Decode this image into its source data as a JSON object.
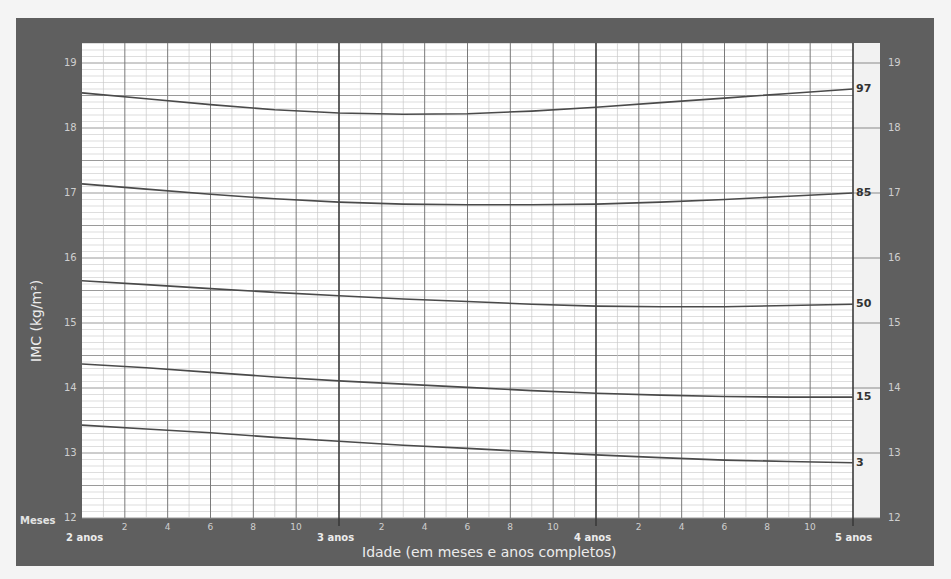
{
  "chart_data": {
    "type": "line",
    "title": "",
    "xlabel": "Idade (em meses e anos completos)",
    "ylabel": "IMC (kg/m²)",
    "x_unit": "months of age",
    "xlim": [
      24,
      60
    ],
    "ylim": [
      12,
      19.3
    ],
    "grid": true,
    "y_ticks": [
      12,
      13,
      14,
      15,
      16,
      17,
      18,
      19
    ],
    "x_month_ticks_label": "Meses",
    "x_month_ticks": [
      "2",
      "4",
      "6",
      "8",
      "10"
    ],
    "x_year_ticks": [
      {
        "label": "2 anos",
        "month": 24
      },
      {
        "label": "3 anos",
        "month": 36
      },
      {
        "label": "4 anos",
        "month": 48
      },
      {
        "label": "5 anos",
        "month": 60
      }
    ],
    "x": [
      24,
      27,
      30,
      33,
      36,
      39,
      42,
      45,
      48,
      51,
      54,
      57,
      60
    ],
    "series": [
      {
        "name": "97",
        "values": [
          18.54,
          18.45,
          18.36,
          18.28,
          18.23,
          18.21,
          18.22,
          18.26,
          18.32,
          18.39,
          18.46,
          18.53,
          18.6
        ]
      },
      {
        "name": "85",
        "values": [
          17.14,
          17.06,
          16.98,
          16.91,
          16.86,
          16.83,
          16.82,
          16.82,
          16.83,
          16.86,
          16.9,
          16.95,
          17.0
        ]
      },
      {
        "name": "50",
        "values": [
          15.65,
          15.59,
          15.53,
          15.47,
          15.42,
          15.37,
          15.33,
          15.29,
          15.26,
          15.25,
          15.25,
          15.27,
          15.29
        ]
      },
      {
        "name": "15",
        "values": [
          14.37,
          14.31,
          14.24,
          14.17,
          14.11,
          14.06,
          14.01,
          13.96,
          13.92,
          13.89,
          13.87,
          13.86,
          13.86
        ]
      },
      {
        "name": "3",
        "values": [
          13.43,
          13.37,
          13.31,
          13.24,
          13.18,
          13.12,
          13.07,
          13.02,
          12.97,
          12.93,
          12.89,
          12.87,
          12.85
        ]
      }
    ],
    "legend": "inline right labels: 97, 85, 50, 15, 3"
  },
  "axis": {
    "y_title": "IMC (kg/m²)",
    "x_title": "Idade (em meses e anos completos)",
    "meses_label": "Meses"
  },
  "colors": {
    "frame": "#5f5f5f",
    "plot_bg": "#ffffff",
    "curve": "#4a4a4a",
    "grid_major": "#7a7a7a",
    "grid_minor": "#c8c8c8"
  }
}
